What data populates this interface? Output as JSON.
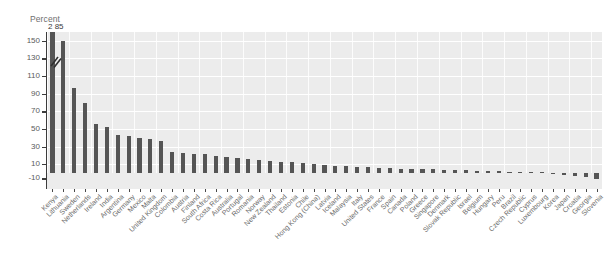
{
  "chart_data": {
    "type": "bar",
    "title": "",
    "subtitle": "",
    "xlabel": "",
    "ylabel": "Percent",
    "ylim": [
      -30,
      160
    ],
    "yticks": [
      150,
      130,
      110,
      90,
      70,
      50,
      30,
      10,
      -10
    ],
    "grid": true,
    "legend": null,
    "axis_break": true,
    "annotations": [
      {
        "text": "2 85",
        "category": "Kenya",
        "note": "value label above truncated first bar"
      }
    ],
    "categories": [
      "Kenya",
      "Lithuania",
      "Sweden",
      "Netherlands",
      "Ireland",
      "India",
      "Argentina",
      "Germany",
      "Mexico",
      "Malta",
      "United Kingdom",
      "Colombia",
      "Austria",
      "Finland",
      "South Africa",
      "Costa Rica",
      "Australia",
      "Portugal",
      "Romania",
      "Norway",
      "New Zealand",
      "Thailand",
      "Estonia",
      "Chile",
      "Hong Kong (China)",
      "Latvia",
      "Iceland",
      "Malaysia",
      "Italy",
      "United States",
      "France",
      "Spain",
      "Canada",
      "Poland",
      "Greece",
      "Singapore",
      "Denmark",
      "Slovak Republic",
      "Israel",
      "Belgium",
      "Hungary",
      "Peru",
      "Brazil",
      "Czech Republic",
      "Cyprus",
      "Luxembourg",
      "Korea",
      "Japan",
      "Croatia",
      "Georgia",
      "Slovenia"
    ],
    "values": [
      285,
      150,
      97,
      80,
      56,
      52,
      43,
      42,
      40,
      39,
      36,
      24,
      23,
      22,
      21,
      19,
      18,
      17,
      16,
      15,
      14,
      13,
      12,
      11,
      10,
      9,
      8,
      8,
      7,
      7,
      6,
      6,
      5,
      5,
      4,
      4,
      3,
      3,
      3,
      2,
      2,
      2,
      1,
      1,
      1,
      1,
      -2,
      -4,
      -6,
      -8,
      -12
    ]
  },
  "labels": {
    "percent_axis": "Percent",
    "truncated_value": "2 85"
  }
}
